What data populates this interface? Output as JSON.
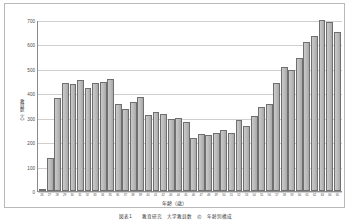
{
  "chart_data": {
    "type": "bar",
    "title": "",
    "xlabel": "年齢（歳）",
    "ylabel": "教員数（人）",
    "ylim": [
      0,
      700
    ],
    "yticks": [
      0,
      100,
      200,
      300,
      400,
      500,
      600,
      700
    ],
    "grid": true,
    "legend": "none",
    "categories": [
      "26",
      "27",
      "28",
      "29",
      "30",
      "31",
      "32",
      "33",
      "34",
      "35",
      "36",
      "37",
      "38",
      "39",
      "40",
      "41",
      "42",
      "43",
      "44",
      "45",
      "46",
      "47",
      "48",
      "49",
      "50",
      "51",
      "52",
      "53",
      "54",
      "55",
      "56",
      "57",
      "58",
      "59",
      "60",
      "61",
      "62",
      "63",
      "64",
      "65"
    ],
    "values": [
      8,
      137,
      381,
      443,
      439,
      455,
      421,
      441,
      447,
      459,
      357,
      337,
      364,
      384,
      313,
      324,
      314,
      296,
      300,
      284,
      219,
      232,
      229,
      237,
      251,
      238,
      291,
      268,
      306,
      344,
      355,
      441,
      507,
      495,
      545,
      612,
      635,
      700,
      690,
      652
    ],
    "bar_color": "#bdbdbd",
    "bar_border": "#6f6f6f"
  },
  "caption": "図表1　　教育研究　大学教員数　の　年齢別構成",
  "axis": {
    "y_title": "教員数（人）",
    "x_title": "年齢（歳）"
  }
}
